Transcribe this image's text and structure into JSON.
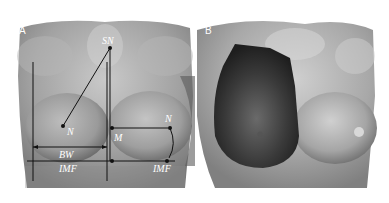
{
  "figure": {
    "panels": [
      {
        "id": "A",
        "label": "A",
        "annotations": {
          "sn": "SN",
          "n_left": "N",
          "n_right": "N",
          "m": "M",
          "bw": "BW",
          "imf_left": "IMF",
          "imf_right": "IMF"
        }
      },
      {
        "id": "B",
        "label": "B"
      }
    ]
  }
}
